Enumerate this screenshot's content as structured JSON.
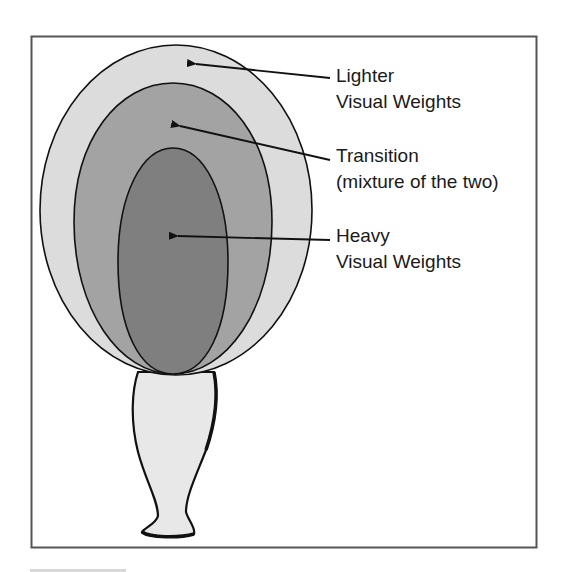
{
  "figure": {
    "frame": {
      "stroke": "#555555"
    },
    "colors": {
      "outer_fill": "#dcdcdc",
      "middle_fill": "#a3a3a3",
      "inner_fill": "#7f7f7f",
      "vase_fill": "#e8e8e8",
      "line": "#111111"
    },
    "labels": [
      {
        "id": "lighter",
        "line1": "Lighter",
        "line2": "Visual Weights"
      },
      {
        "id": "transition",
        "line1": "Transition",
        "line2": "(mixture of the two)"
      },
      {
        "id": "heavy",
        "line1": "Heavy",
        "line2": "Visual Weights"
      }
    ]
  }
}
